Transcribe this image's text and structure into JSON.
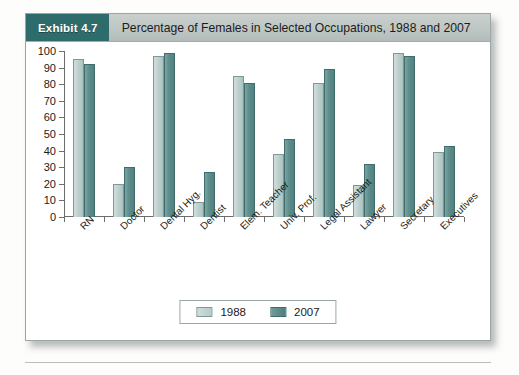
{
  "exhibit": {
    "badge": "Exhibit 4.7",
    "title": "Percentage of Females in Selected Occupations, 1988 and 2007"
  },
  "colors": {
    "badge_bg": "#2e6b6b",
    "header_bg": "#bfc7c5",
    "series_1988": "#bfd2d0",
    "series_2007": "#5f8d8c",
    "axis": "#6d6d6d",
    "card_border": "#9aa7a6"
  },
  "legend": {
    "items": [
      {
        "label": "1988",
        "key": "y1988"
      },
      {
        "label": "2007",
        "key": "y2007"
      }
    ]
  },
  "chart_data": {
    "type": "bar",
    "title": "Percentage of Females in Selected Occupations, 1988 and 2007",
    "xlabel": "",
    "ylabel": "",
    "ylim": [
      0,
      100
    ],
    "yticks": [
      0,
      10,
      20,
      30,
      40,
      50,
      60,
      70,
      80,
      90,
      100
    ],
    "grid": false,
    "legend_position": "bottom-center",
    "categories": [
      "RN",
      "Doctor",
      "Dental Hyg.",
      "Dentist",
      "Elem. Teacher",
      "Univ. Prof.",
      "Legal Assistant",
      "Lawyer",
      "Secretary",
      "Executives"
    ],
    "series": [
      {
        "name": "1988",
        "values": [
          95,
          20,
          97,
          9,
          85,
          38,
          81,
          19,
          99,
          39
        ]
      },
      {
        "name": "2007",
        "values": [
          92,
          30,
          99,
          27,
          81,
          47,
          89,
          32,
          97,
          43
        ]
      }
    ]
  }
}
